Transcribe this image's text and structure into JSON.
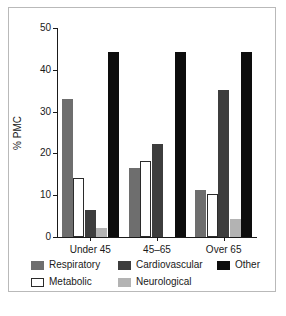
{
  "chart_data": {
    "type": "bar",
    "title": "",
    "subtitle": "",
    "xlabel": "",
    "ylabel": "% PMC",
    "categories": [
      "Under 45",
      "45–65",
      "Over 65"
    ],
    "ylim": [
      0,
      50
    ],
    "yticks": [
      0,
      10,
      20,
      30,
      40,
      50
    ],
    "ytick_labels": [
      "0",
      "10",
      "20",
      "30",
      "40",
      "50"
    ],
    "grid": false,
    "legend_position": "below-axes",
    "series": [
      {
        "name": "Respiratory",
        "color": "#6e6e6e",
        "values": [
          33.1,
          16.4,
          11.3
        ]
      },
      {
        "name": "Metabolic",
        "color": "#ffffff",
        "values": [
          14.2,
          18.2,
          10.3
        ]
      },
      {
        "name": "Cardiovascular",
        "color": "#3d3d3d",
        "values": [
          6.4,
          22.3,
          35.2
        ]
      },
      {
        "name": "Neurological",
        "color": "#b3b3b3",
        "values": [
          2.1,
          0.0,
          4.3
        ]
      },
      {
        "name": "Other",
        "color": "#0d0d0d",
        "values": [
          44.2,
          44.2,
          44.2
        ]
      }
    ]
  },
  "axis": {
    "y_label": "% PMC",
    "y_tick_0": "0",
    "y_tick_1": "10",
    "y_tick_2": "20",
    "y_tick_3": "30",
    "y_tick_4": "40",
    "y_tick_5": "50",
    "x_label_0": "Under 45",
    "x_label_1": "45–65",
    "x_label_2": "Over 65"
  },
  "legend": {
    "items": [
      {
        "label": "Respiratory",
        "color": "#6e6e6e"
      },
      {
        "label": "Cardiovascular",
        "color": "#3d3d3d"
      },
      {
        "label": "Other",
        "color": "#0d0d0d"
      },
      {
        "label": "Metabolic",
        "color": "#ffffff"
      },
      {
        "label": "Neurological",
        "color": "#b3b3b3"
      }
    ]
  }
}
